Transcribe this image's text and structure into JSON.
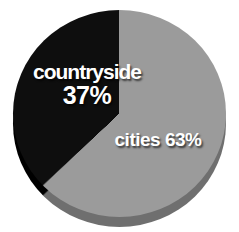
{
  "page": {
    "background_color": "#ffffff"
  },
  "chart_data": {
    "type": "pie",
    "title": "",
    "direction": "clockwise",
    "start_angle_deg": 0,
    "effect": "3d-depth",
    "label_color": "#ffffff",
    "slices": [
      {
        "label": "cities",
        "value": 63,
        "display": "cities 63%",
        "color": "#9b9b9b",
        "side_color": "#6f6f6f"
      },
      {
        "label": "countryside",
        "value": 37,
        "display_line1": "countryside",
        "display_line2": "37%",
        "color": "#0e0e0e",
        "side_color": "#000000"
      }
    ]
  }
}
